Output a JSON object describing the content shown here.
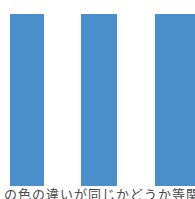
{
  "figure": {
    "background_color": "#ffffff",
    "bar_color": "#4a8ecc",
    "top_text_fragment": "。。。。。。。。。。",
    "bottom_text_fragment": "の色の違いが同じかどうか等関"
  },
  "chart_data": {
    "type": "bar",
    "title": "",
    "subtitle": "",
    "xlabel": "",
    "ylabel": "",
    "categories": [
      "1",
      "2",
      "3"
    ],
    "values": [
      100,
      100,
      100
    ],
    "ylim": [
      0,
      100
    ],
    "grid": false,
    "legend": null,
    "bars": [
      {
        "name": "bar-1",
        "label": "1",
        "value": 100,
        "color": "#4a8ecc",
        "left": 10,
        "width": 34,
        "top": 14,
        "height": 172
      },
      {
        "name": "bar-2",
        "label": "2",
        "value": 100,
        "color": "#4a8ecc",
        "left": 81,
        "width": 36,
        "top": 14,
        "height": 172
      },
      {
        "name": "bar-3",
        "label": "3",
        "value": 100,
        "color": "#4a8ecc",
        "left": 155,
        "width": 40,
        "top": 14,
        "height": 172
      }
    ],
    "annotations": []
  }
}
